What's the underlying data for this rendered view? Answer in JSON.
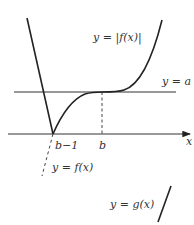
{
  "diagram": {
    "title": "",
    "labels": {
      "abs_f": "y = |f(x)|",
      "line_a": "y = a",
      "x_axis": "x",
      "tick_b_minus_1": "b−1",
      "tick_b": "b",
      "f": "y = f(x)",
      "g": "y = g(x)"
    },
    "colors": {
      "curve": "#222222",
      "text": "#333333",
      "background": "#ffffff"
    },
    "elements": [
      {
        "name": "curve y=|f(x)|",
        "type": "curve"
      },
      {
        "name": "horizontal line y=a",
        "type": "line"
      },
      {
        "name": "x-axis",
        "type": "axis-arrow"
      },
      {
        "name": "dashed vertical at x=b",
        "type": "dashed-line"
      },
      {
        "name": "dashed continuation of y=f(x) below axis",
        "type": "dashed-line"
      },
      {
        "name": "line y=g(x)",
        "type": "line"
      }
    ]
  }
}
